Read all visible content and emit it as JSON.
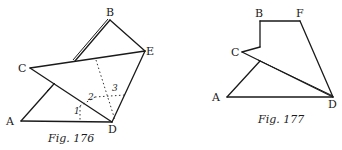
{
  "figures": [
    {
      "id": "fig176",
      "caption": "Fig. 176",
      "points": {
        "A": "A",
        "B": "B",
        "C": "C",
        "D": "D",
        "E": "E"
      },
      "fold_numbers": [
        "1",
        "2",
        "3"
      ]
    },
    {
      "id": "fig177",
      "caption": "Fig. 177",
      "points": {
        "A": "A",
        "B": "B",
        "C": "C",
        "D": "D",
        "F": "F"
      }
    }
  ]
}
